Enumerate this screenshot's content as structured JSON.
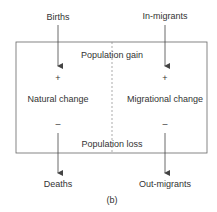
{
  "diagram": {
    "inputs": {
      "left": "Births",
      "right": "In-migrants"
    },
    "outputs": {
      "left": "Deaths",
      "right": "Out-migrants"
    },
    "box": {
      "top_label": "Population gain",
      "bottom_label": "Population loss",
      "left_label": "Natural change",
      "right_label": "Migrational change",
      "plus_sign": "+",
      "minus_sign": "–"
    },
    "caption": "(b)",
    "colors": {
      "line": "#555555",
      "text": "#333333"
    }
  }
}
